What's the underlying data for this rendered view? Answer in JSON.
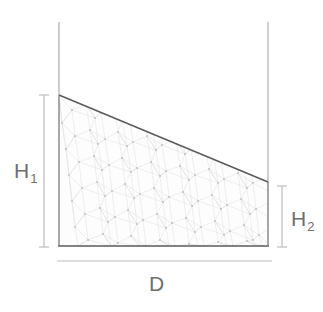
{
  "diagram": {
    "type": "engineering-cross-section",
    "background_color": "#ffffff",
    "labels": {
      "height_left": {
        "symbol": "H",
        "subscript": "1",
        "text": "H1"
      },
      "height_right": {
        "symbol": "H",
        "subscript": "2",
        "text": "H2"
      },
      "width": {
        "symbol": "D",
        "subscript": "",
        "text": "D"
      }
    },
    "colors": {
      "wall_line": "#b8b8b8",
      "surface_line": "#5a5a5a",
      "bottom_line": "#5a5a5a",
      "dimension_line": "#bdbdbd",
      "mesh_line": "#d9d9d9",
      "mesh_node": "#c4c4c4",
      "fill": "#fdfdfd",
      "label_text": "#6e6e6e"
    },
    "geometry": {
      "left_wall_x": 59,
      "right_wall_x": 268,
      "wall_top_y": 22,
      "bottom_y": 246,
      "surface_left_y": 95,
      "surface_right_y": 182,
      "h1_dim_x": 44,
      "h1_dim_top_y": 95,
      "h1_dim_bottom_y": 247,
      "h2_dim_x": 282,
      "h2_dim_top_y": 186,
      "h2_dim_bottom_y": 247,
      "d_dim_y": 261,
      "d_dim_left_x": 57,
      "d_dim_right_x": 272
    },
    "annotations": {
      "h1_meaning": "Liquid depth at left wall",
      "h2_meaning": "Liquid depth at right wall",
      "d_meaning": "Horizontal span / tank width",
      "surface_meaning": "Inclined liquid free surface sloping down from left to right",
      "mesh_meaning": "Unstructured triangular finite-element mesh filling the liquid domain"
    }
  }
}
